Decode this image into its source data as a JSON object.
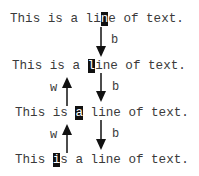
{
  "lines": [
    {
      "before": "This is a li",
      "cursor": "n",
      "after": "e of text."
    },
    {
      "before": "This is a ",
      "cursor": "l",
      "after": "ine of text."
    },
    {
      "before": "This is ",
      "cursor": "a",
      "after": " line of text."
    },
    {
      "before": "This ",
      "cursor": "i",
      "after": "s a line of text."
    }
  ],
  "motions": [
    {
      "key": "b",
      "direction": "down",
      "from_line": 1,
      "to_line": 2
    },
    {
      "key": "b",
      "direction": "down",
      "from_line": 2,
      "to_line": 3
    },
    {
      "key": "b",
      "direction": "down",
      "from_line": 3,
      "to_line": 4
    },
    {
      "key": "w",
      "direction": "up",
      "from_line": 3,
      "to_line": 2
    },
    {
      "key": "w",
      "direction": "up",
      "from_line": 4,
      "to_line": 3
    }
  ],
  "colors": {
    "text": "#3a3a3a",
    "cursor_bg": "#111111",
    "cursor_fg": "#ffffff",
    "arrow": "#111111"
  }
}
